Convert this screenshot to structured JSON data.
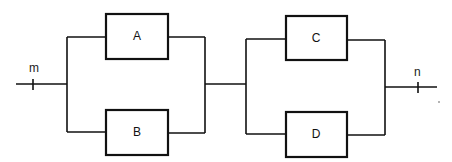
{
  "diagram": {
    "type": "series-parallel block diagram",
    "terminals": {
      "input": {
        "label": "m"
      },
      "output": {
        "label": "n"
      }
    },
    "stages": [
      {
        "name": "stage-1",
        "parallel_blocks": [
          {
            "label": "A"
          },
          {
            "label": "B"
          }
        ]
      },
      {
        "name": "stage-2",
        "parallel_blocks": [
          {
            "label": "C"
          },
          {
            "label": "D"
          }
        ]
      }
    ],
    "connection": "stage-1 in series with stage-2; blocks within each stage in parallel"
  }
}
